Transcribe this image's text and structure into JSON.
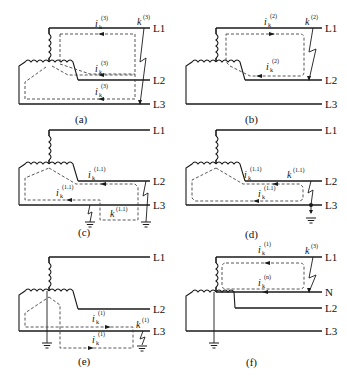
{
  "diagrams": [
    {
      "caption": "(a)",
      "lines": [
        "L1",
        "L2",
        "L3"
      ],
      "current_label": "i",
      "current_sub": "k",
      "current_sup": "(3)",
      "fault_label": "k",
      "fault_sup": "(3)"
    },
    {
      "caption": "(b)",
      "lines": [
        "L1",
        "L2",
        "L3"
      ],
      "current_label": "i",
      "current_sub": "k",
      "current_sup": "(2)",
      "fault_label": "k",
      "fault_sup": "(2)"
    },
    {
      "caption": "(c)",
      "lines": [
        "L1",
        "L2",
        "L3"
      ],
      "current_label": "i",
      "current_sub": "k",
      "current_sup": "(1.1)",
      "fault_label": "k",
      "fault_sup": "(1.1)"
    },
    {
      "caption": "(d)",
      "lines": [
        "L1",
        "L2",
        "L3"
      ],
      "current_label": "i",
      "current_sub": "k",
      "current_sup": "(1.1)",
      "fault_label": "k",
      "fault_sup": "(1.1)"
    },
    {
      "caption": "(e)",
      "lines": [
        "L1",
        "L2",
        "L3"
      ],
      "current_label": "i",
      "current_sub": "k",
      "current_sup": "(1)",
      "fault_label": "k",
      "fault_sup": "(1)"
    },
    {
      "caption": "(f)",
      "lines": [
        "L1",
        "N",
        "L2",
        "L3"
      ],
      "current_label": "i",
      "current_sub": "k",
      "current_sup": "(1)",
      "neutral_current_sup": "(n)",
      "fault_label": "k",
      "fault_sup": "(3)"
    }
  ]
}
